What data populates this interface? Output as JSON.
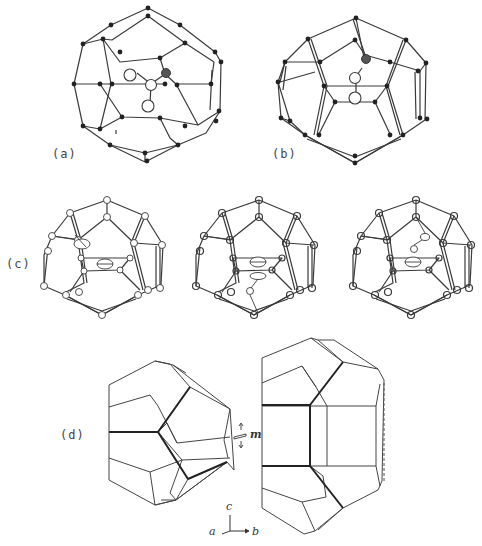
{
  "figure": {
    "panels": [
      {
        "id": "a",
        "label": "(a)",
        "description": "Pentagonal dodecahedral cage with guest molecule (three-atom bent guest), filled-circle vertices"
      },
      {
        "id": "b",
        "label": "(b)",
        "description": "Cage viewed from another orientation with two-atom guest, filled-circle vertices"
      },
      {
        "id": "c",
        "label": "(c)",
        "description": "Three thermal-ellipsoid views of cages with disordered guest molecules"
      },
      {
        "id": "d",
        "label": "(d)",
        "description": "Polyhedral outlines of two cage types related by mirror plane m"
      }
    ],
    "mirror_label": "m",
    "axes": {
      "c": "c",
      "a": "a",
      "b": "b"
    }
  },
  "colors": {
    "background": "#ffffff",
    "line": "#3a3a3a",
    "atom_fill": "#222222",
    "open_atom": "#ffffff"
  }
}
